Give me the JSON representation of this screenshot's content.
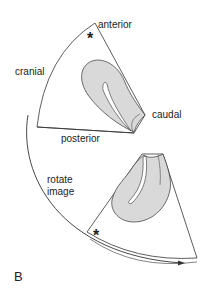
{
  "figure": {
    "panel_label": "B",
    "labels": {
      "anterior": "anterior",
      "cranial": "cranial",
      "caudal": "caudal",
      "posterior": "posterior",
      "rotate_line1": "rotate",
      "rotate_line2": "image"
    },
    "markers": {
      "asterisk": "*"
    },
    "colors": {
      "stroke": "#333333",
      "fill_gray": "#d9d9d9",
      "background": "#ffffff"
    }
  }
}
